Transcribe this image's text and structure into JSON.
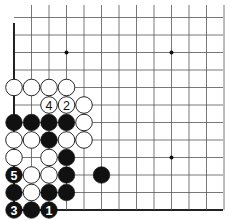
{
  "board": {
    "description": "Go board corner diagram (lower-left corner), numbered move sequence",
    "columns": 13,
    "rows": 12,
    "origin_x": 14,
    "origin_y_bottom": 210,
    "spacing": 17.5,
    "line_color": "#555555",
    "edge_color": "#222222",
    "star_points": [
      [
        3,
        3
      ],
      [
        9,
        3
      ],
      [
        3,
        9
      ],
      [
        9,
        9
      ]
    ],
    "stones": [
      {
        "col": 0,
        "row": 0,
        "color": "black",
        "label": "3"
      },
      {
        "col": 1,
        "row": 0,
        "color": "black",
        "label": ""
      },
      {
        "col": 2,
        "row": 0,
        "color": "black",
        "label": "1"
      },
      {
        "col": 0,
        "row": 1,
        "color": "black",
        "label": ""
      },
      {
        "col": 1,
        "row": 1,
        "color": "white",
        "label": ""
      },
      {
        "col": 2,
        "row": 1,
        "color": "black",
        "label": ""
      },
      {
        "col": 3,
        "row": 1,
        "color": "black",
        "label": ""
      },
      {
        "col": 0,
        "row": 2,
        "color": "black",
        "label": "5"
      },
      {
        "col": 1,
        "row": 2,
        "color": "white",
        "label": ""
      },
      {
        "col": 2,
        "row": 2,
        "color": "white",
        "label": ""
      },
      {
        "col": 3,
        "row": 2,
        "color": "black",
        "label": ""
      },
      {
        "col": 5,
        "row": 2,
        "color": "black",
        "label": ""
      },
      {
        "col": 0,
        "row": 3,
        "color": "white",
        "label": ""
      },
      {
        "col": 2,
        "row": 3,
        "color": "white",
        "label": ""
      },
      {
        "col": 3,
        "row": 3,
        "color": "black",
        "label": ""
      },
      {
        "col": 0,
        "row": 4,
        "color": "white",
        "label": ""
      },
      {
        "col": 1,
        "row": 4,
        "color": "white",
        "label": ""
      },
      {
        "col": 2,
        "row": 4,
        "color": "black",
        "label": ""
      },
      {
        "col": 3,
        "row": 4,
        "color": "white",
        "label": ""
      },
      {
        "col": 4,
        "row": 4,
        "color": "white",
        "label": ""
      },
      {
        "col": 0,
        "row": 5,
        "color": "black",
        "label": ""
      },
      {
        "col": 1,
        "row": 5,
        "color": "black",
        "label": ""
      },
      {
        "col": 2,
        "row": 5,
        "color": "black",
        "label": ""
      },
      {
        "col": 3,
        "row": 5,
        "color": "black",
        "label": ""
      },
      {
        "col": 4,
        "row": 5,
        "color": "white",
        "label": ""
      },
      {
        "col": 2,
        "row": 6,
        "color": "white",
        "label": "4"
      },
      {
        "col": 3,
        "row": 6,
        "color": "white",
        "label": "2"
      },
      {
        "col": 4,
        "row": 6,
        "color": "white",
        "label": ""
      },
      {
        "col": 0,
        "row": 7,
        "color": "white",
        "label": ""
      },
      {
        "col": 1,
        "row": 7,
        "color": "white",
        "label": ""
      },
      {
        "col": 2,
        "row": 7,
        "color": "white",
        "label": ""
      },
      {
        "col": 3,
        "row": 7,
        "color": "white",
        "label": ""
      }
    ]
  }
}
